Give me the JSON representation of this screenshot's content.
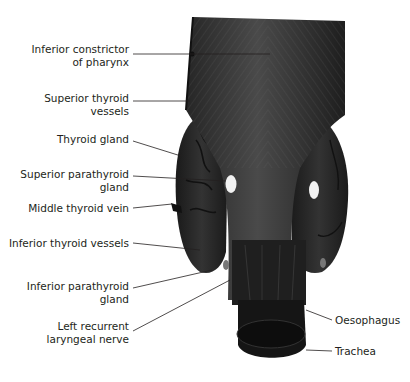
{
  "figure": {
    "type": "anatomical-illustration",
    "colors": {
      "tissue_dark": "#1c1c1c",
      "tissue_mid": "#2e2e2e",
      "tissue_highlight": "#5a5a5a",
      "parathyroid": "#f2f2f2",
      "leader_line": "#231f20",
      "text": "#231f20",
      "background": "#ffffff"
    }
  },
  "labels": {
    "left": [
      {
        "id": "inferior-constrictor",
        "lines": [
          "Inferior constrictor",
          "of pharynx"
        ],
        "x": 129,
        "y": 43
      },
      {
        "id": "superior-thyroid-vessels",
        "lines": [
          "Superior thyroid",
          "vessels"
        ],
        "x": 129,
        "y": 93
      },
      {
        "id": "thyroid-gland",
        "lines": [
          "Thyroid gland"
        ],
        "x": 129,
        "y": 135
      },
      {
        "id": "superior-parathyroid",
        "lines": [
          "Superior parathyroid",
          "gland"
        ],
        "x": 129,
        "y": 170
      },
      {
        "id": "middle-thyroid-vein",
        "lines": [
          "Middle thyroid vein"
        ],
        "x": 129,
        "y": 202
      },
      {
        "id": "inferior-thyroid-vessels",
        "lines": [
          "Inferior thyroid vessels"
        ],
        "x": 129,
        "y": 237
      },
      {
        "id": "inferior-parathyroid",
        "lines": [
          "Inferior parathyroid",
          "gland"
        ],
        "x": 129,
        "y": 280
      },
      {
        "id": "left-recurrent-laryngeal",
        "lines": [
          "Left recurrent",
          "laryngeal nerve"
        ],
        "x": 129,
        "y": 320
      }
    ],
    "right": [
      {
        "id": "oesophagus",
        "lines": [
          "Oesophagus"
        ],
        "x": 335,
        "y": 314
      },
      {
        "id": "trachea",
        "lines": [
          "Trachea"
        ],
        "x": 335,
        "y": 346
      }
    ]
  }
}
